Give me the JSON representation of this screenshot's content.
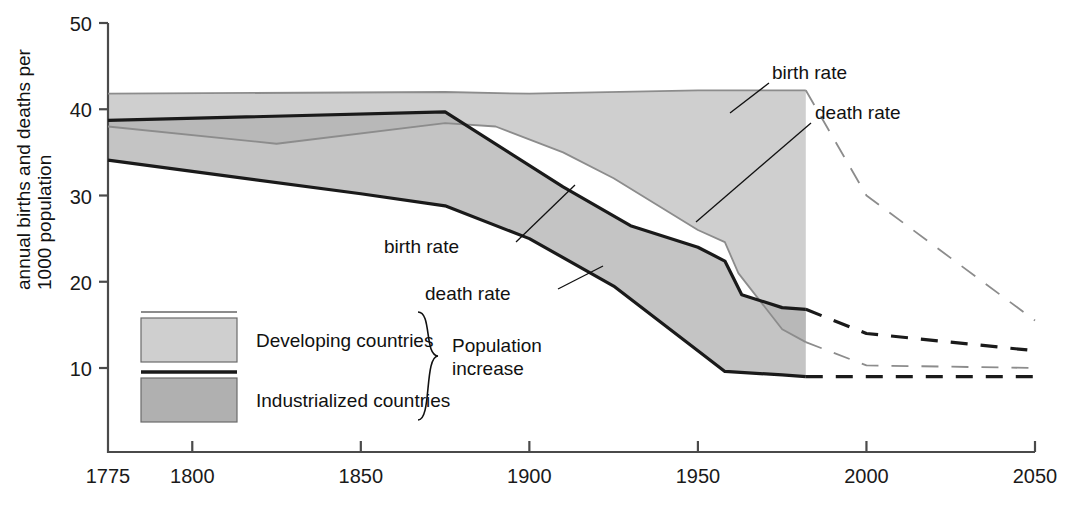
{
  "chart_data": {
    "type": "area",
    "title": "",
    "xlabel": "",
    "ylabel": "annual births and deaths per 1000 population",
    "xlim": [
      1775,
      2050
    ],
    "ylim": [
      0,
      50
    ],
    "xticks": [
      "1775",
      "1800",
      "1850",
      "1900",
      "1950",
      "2000",
      "2050"
    ],
    "xtick_values": [
      1775,
      1800,
      1850,
      1900,
      1950,
      2000,
      2050
    ],
    "yticks": [
      "10",
      "20",
      "30",
      "40",
      "50"
    ],
    "ytick_values": [
      10,
      20,
      30,
      40,
      50
    ],
    "grid": false,
    "legend_position": "lower-left-inside",
    "projection_starts": 1982,
    "series": [
      {
        "name": "Developing countries birth rate",
        "group": "Developing countries",
        "measure": "birth rate",
        "color": "#8c8c8c",
        "solid": [
          [
            1775,
            41.8
          ],
          [
            1875,
            42.0
          ],
          [
            1900,
            41.8
          ],
          [
            1950,
            42.2
          ],
          [
            1982,
            42.2
          ]
        ],
        "dashed": [
          [
            1982,
            42.2
          ],
          [
            2000,
            30.0
          ],
          [
            2050,
            15.5
          ]
        ]
      },
      {
        "name": "Developing countries death rate",
        "group": "Developing countries",
        "measure": "death rate",
        "color": "#8c8c8c",
        "solid": [
          [
            1775,
            38.0
          ],
          [
            1825,
            36.0
          ],
          [
            1875,
            38.4
          ],
          [
            1890,
            38.0
          ],
          [
            1910,
            35.0
          ],
          [
            1925,
            32.0
          ],
          [
            1950,
            26.0
          ],
          [
            1958,
            24.6
          ],
          [
            1962,
            21.0
          ],
          [
            1975,
            14.5
          ],
          [
            1982,
            13.0
          ]
        ],
        "dashed": [
          [
            1982,
            13.0
          ],
          [
            2000,
            10.3
          ],
          [
            2050,
            10.0
          ]
        ]
      },
      {
        "name": "Industrialized countries birth rate",
        "group": "Industrialized countries",
        "measure": "birth rate",
        "color": "#1a1a1a",
        "solid": [
          [
            1775,
            38.7
          ],
          [
            1875,
            39.7
          ],
          [
            1910,
            31.0
          ],
          [
            1930,
            26.5
          ],
          [
            1950,
            24.0
          ],
          [
            1958,
            22.4
          ],
          [
            1963,
            18.5
          ],
          [
            1975,
            17.0
          ],
          [
            1982,
            16.8
          ]
        ],
        "dashed": [
          [
            1982,
            16.8
          ],
          [
            2000,
            14.0
          ],
          [
            2050,
            12.0
          ]
        ]
      },
      {
        "name": "Industrialized countries death rate",
        "group": "Industrialized countries",
        "measure": "death rate",
        "color": "#1a1a1a",
        "solid": [
          [
            1775,
            34.1
          ],
          [
            1800,
            32.8
          ],
          [
            1850,
            30.2
          ],
          [
            1875,
            28.8
          ],
          [
            1900,
            25.0
          ],
          [
            1925,
            19.5
          ],
          [
            1950,
            12.0
          ],
          [
            1958,
            9.6
          ],
          [
            1975,
            9.2
          ],
          [
            1982,
            9.0
          ]
        ],
        "dashed": [
          [
            1982,
            9.0
          ],
          [
            2000,
            9.0
          ],
          [
            2050,
            9.0
          ]
        ]
      }
    ]
  },
  "axis": {
    "y_title_line1": "annual births and deaths per",
    "y_title_line2": "1000 population"
  },
  "annotations": {
    "developing_birth": "birth rate",
    "developing_death": "death rate",
    "industrialized_birth": "birth rate",
    "industrialized_death": "death rate"
  },
  "legend": {
    "items": [
      {
        "label": "Developing countries",
        "swatch_fill": "#cfcfcf",
        "rule_color": "#8c8c8c"
      },
      {
        "label": "Industrialized countries",
        "swatch_fill": "#b0b0b0",
        "rule_color": "#1a1a1a"
      }
    ],
    "brace_label_line1": "Population",
    "brace_label_line2": "increase"
  },
  "colors": {
    "developing_band": "#cfcfcf",
    "industrialized_band": "#b0b0b0",
    "developing_line": "#8c8c8c",
    "industrialized_line": "#1a1a1a",
    "axis": "#4a4a4a",
    "text": "#111111"
  }
}
